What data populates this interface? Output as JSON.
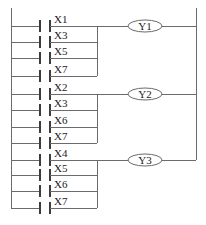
{
  "diagram": {
    "type": "ladder-logic",
    "rails": {
      "left_x": 11,
      "right_x": 196
    },
    "rungs": [
      {
        "coil": "Y1",
        "coil_y": 26,
        "contacts": [
          {
            "label": "X1",
            "y": 26
          },
          {
            "label": "X3",
            "y": 42
          },
          {
            "label": "X5",
            "y": 58
          },
          {
            "label": "X7",
            "y": 76
          }
        ]
      },
      {
        "coil": "Y2",
        "coil_y": 94,
        "contacts": [
          {
            "label": "X2",
            "y": 94
          },
          {
            "label": "X3",
            "y": 110
          },
          {
            "label": "X6",
            "y": 127
          },
          {
            "label": "X7",
            "y": 143
          }
        ]
      },
      {
        "coil": "Y3",
        "coil_y": 160,
        "contacts": [
          {
            "label": "X4",
            "y": 160
          },
          {
            "label": "X5",
            "y": 175
          },
          {
            "label": "X6",
            "y": 191
          },
          {
            "label": "X7",
            "y": 208
          }
        ]
      }
    ],
    "colors": {
      "wire": "#6b6b6b",
      "text": "#222222",
      "background": "#ffffff"
    }
  }
}
